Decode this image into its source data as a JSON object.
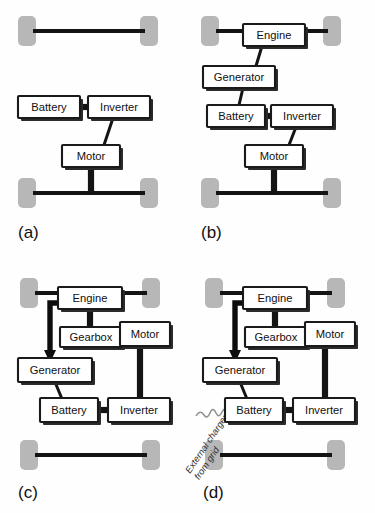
{
  "figure": {
    "colors": {
      "wheel_gray": "#b7b7b7",
      "line_black": "#141414",
      "box_fill": "#ffffff",
      "box_stroke": "#1a1a1a",
      "shadow": "#2b2b2b",
      "squiggle_gray": "#8d8d8d",
      "background": "#fefefe"
    },
    "panels": [
      {
        "id": "a",
        "label": "(a)",
        "name": "battery-electric-vehicle",
        "components": [
          "Battery",
          "Inverter",
          "Motor"
        ],
        "boxes": [
          {
            "key": "battery",
            "label": "Battery",
            "x": 18,
            "y": 96,
            "w": 62,
            "h": 22
          },
          {
            "key": "inverter",
            "label": "Inverter",
            "x": 88,
            "y": 96,
            "w": 62,
            "h": 22
          },
          {
            "key": "motor",
            "label": "Motor",
            "x": 62,
            "y": 145,
            "w": 58,
            "h": 22
          }
        ],
        "wheels": [
          {
            "key": "front-left",
            "x": 18,
            "y": 16,
            "w": 18,
            "h": 30
          },
          {
            "key": "front-right",
            "x": 140,
            "y": 16,
            "w": 18,
            "h": 30
          },
          {
            "key": "rear-left",
            "x": 18,
            "y": 178,
            "w": 18,
            "h": 30
          },
          {
            "key": "rear-right",
            "x": 140,
            "y": 178,
            "w": 18,
            "h": 30
          }
        ],
        "links": [
          {
            "from": "Battery",
            "to": "Inverter",
            "type": "electrical"
          },
          {
            "from": "Inverter",
            "to": "Motor",
            "type": "electrical"
          },
          {
            "from": "Motor",
            "to": "rear-axle",
            "type": "mechanical"
          }
        ]
      },
      {
        "id": "b",
        "label": "(b)",
        "name": "series-hybrid-vehicle",
        "components": [
          "Engine",
          "Generator",
          "Battery",
          "Inverter",
          "Motor"
        ],
        "boxes": [
          {
            "key": "engine",
            "label": "Engine",
            "x": 243,
            "y": 24,
            "w": 62,
            "h": 22
          },
          {
            "key": "generator",
            "label": "Generator",
            "x": 203,
            "y": 66,
            "w": 72,
            "h": 22
          },
          {
            "key": "battery",
            "label": "Battery",
            "x": 207,
            "y": 105,
            "w": 58,
            "h": 22
          },
          {
            "key": "inverter",
            "label": "Inverter",
            "x": 271,
            "y": 105,
            "w": 62,
            "h": 22
          },
          {
            "key": "motor",
            "label": "Motor",
            "x": 245,
            "y": 145,
            "w": 58,
            "h": 22
          }
        ],
        "wheels": [
          {
            "key": "front-left",
            "x": 201,
            "y": 16,
            "w": 18,
            "h": 30
          },
          {
            "key": "front-right",
            "x": 323,
            "y": 16,
            "w": 18,
            "h": 30
          },
          {
            "key": "rear-left",
            "x": 201,
            "y": 178,
            "w": 18,
            "h": 30
          },
          {
            "key": "rear-right",
            "x": 323,
            "y": 178,
            "w": 18,
            "h": 30
          }
        ],
        "links": [
          {
            "from": "front-axle",
            "to": "Engine",
            "type": "mechanical"
          },
          {
            "from": "Engine",
            "to": "Generator",
            "type": "mechanical"
          },
          {
            "from": "Generator",
            "to": "Battery",
            "type": "electrical"
          },
          {
            "from": "Battery",
            "to": "Inverter",
            "type": "electrical"
          },
          {
            "from": "Inverter",
            "to": "Motor",
            "type": "electrical"
          },
          {
            "from": "Motor",
            "to": "rear-axle",
            "type": "mechanical"
          }
        ]
      },
      {
        "id": "c",
        "label": "(c)",
        "name": "series-parallel-hybrid-vehicle",
        "components": [
          "Engine",
          "Gearbox",
          "Motor",
          "Generator",
          "Battery",
          "Inverter"
        ],
        "boxes": [
          {
            "key": "engine",
            "label": "Engine",
            "x": 58,
            "y": 287,
            "w": 64,
            "h": 22
          },
          {
            "key": "gearbox",
            "label": "Gearbox",
            "x": 60,
            "y": 327,
            "w": 62,
            "h": 20
          },
          {
            "key": "motor",
            "label": "Motor",
            "x": 120,
            "y": 322,
            "w": 50,
            "h": 24
          },
          {
            "key": "generator",
            "label": "Generator",
            "x": 18,
            "y": 358,
            "w": 74,
            "h": 24
          },
          {
            "key": "battery",
            "label": "Battery",
            "x": 40,
            "y": 398,
            "w": 58,
            "h": 24
          },
          {
            "key": "inverter",
            "label": "Inverter",
            "x": 108,
            "y": 398,
            "w": 62,
            "h": 24
          }
        ],
        "wheels": [
          {
            "key": "front-left",
            "x": 20,
            "y": 278,
            "w": 18,
            "h": 30
          },
          {
            "key": "front-right",
            "x": 142,
            "y": 278,
            "w": 18,
            "h": 30
          },
          {
            "key": "rear-left",
            "x": 20,
            "y": 440,
            "w": 18,
            "h": 30
          },
          {
            "key": "rear-right",
            "x": 142,
            "y": 440,
            "w": 18,
            "h": 30
          }
        ],
        "links": [
          {
            "from": "front-axle",
            "to": "Engine",
            "type": "mechanical"
          },
          {
            "from": "Engine",
            "to": "Generator",
            "type": "mechanical-arrow"
          },
          {
            "from": "Engine",
            "to": "Gearbox",
            "type": "mechanical"
          },
          {
            "from": "Gearbox",
            "to": "Motor",
            "type": "mechanical"
          },
          {
            "from": "Motor",
            "to": "Inverter",
            "type": "electrical"
          },
          {
            "from": "Generator",
            "to": "Battery",
            "type": "electrical"
          },
          {
            "from": "Battery",
            "to": "Inverter",
            "type": "electrical"
          }
        ]
      },
      {
        "id": "d",
        "label": "(d)",
        "name": "plug-in-hybrid-vehicle",
        "components": [
          "Engine",
          "Gearbox",
          "Motor",
          "Generator",
          "Battery",
          "Inverter"
        ],
        "annotation": "External charger from grid",
        "annotation_lines": [
          "External charger",
          "from grid"
        ],
        "boxes": [
          {
            "key": "engine",
            "label": "Engine",
            "x": 243,
            "y": 287,
            "w": 64,
            "h": 22
          },
          {
            "key": "gearbox",
            "label": "Gearbox",
            "x": 245,
            "y": 327,
            "w": 62,
            "h": 20
          },
          {
            "key": "motor",
            "label": "Motor",
            "x": 305,
            "y": 322,
            "w": 50,
            "h": 24
          },
          {
            "key": "generator",
            "label": "Generator",
            "x": 203,
            "y": 358,
            "w": 74,
            "h": 24
          },
          {
            "key": "battery",
            "label": "Battery",
            "x": 225,
            "y": 398,
            "w": 58,
            "h": 24
          },
          {
            "key": "inverter",
            "label": "Inverter",
            "x": 293,
            "y": 398,
            "w": 62,
            "h": 24
          }
        ],
        "wheels": [
          {
            "key": "front-left",
            "x": 205,
            "y": 278,
            "w": 18,
            "h": 30
          },
          {
            "key": "front-right",
            "x": 327,
            "y": 278,
            "w": 18,
            "h": 30
          },
          {
            "key": "rear-left",
            "x": 205,
            "y": 440,
            "w": 18,
            "h": 30
          },
          {
            "key": "rear-right",
            "x": 327,
            "y": 440,
            "w": 18,
            "h": 30
          }
        ],
        "links": [
          {
            "from": "front-axle",
            "to": "Engine",
            "type": "mechanical"
          },
          {
            "from": "Engine",
            "to": "Generator",
            "type": "mechanical-arrow"
          },
          {
            "from": "Engine",
            "to": "Gearbox",
            "type": "mechanical"
          },
          {
            "from": "Gearbox",
            "to": "Motor",
            "type": "mechanical"
          },
          {
            "from": "Motor",
            "to": "Inverter",
            "type": "electrical"
          },
          {
            "from": "Generator",
            "to": "Battery",
            "type": "electrical"
          },
          {
            "from": "Battery",
            "to": "Inverter",
            "type": "electrical"
          },
          {
            "from": "External charger from grid",
            "to": "Battery",
            "type": "grid-charge"
          }
        ]
      }
    ]
  }
}
